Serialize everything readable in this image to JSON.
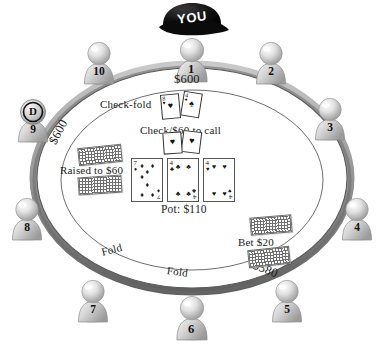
{
  "diagram": {
    "table": {
      "pot_label": "Pot: $110",
      "rim_color": "#8a8a8a",
      "felt_color": "#ffffff",
      "line_color": "#555555"
    },
    "hero": {
      "cap_label": "YOU",
      "cap_color": "#111111"
    },
    "stacks": [
      {
        "id": "stack-top",
        "value": "$600"
      },
      {
        "id": "stack-left",
        "value": "$600"
      },
      {
        "id": "stack-right",
        "value": "$580"
      }
    ],
    "actions": [
      {
        "id": "action-check-fold",
        "label": "Check-fold"
      },
      {
        "id": "action-check-call",
        "label": "Check/$60 to call"
      },
      {
        "id": "action-raise",
        "label": "Raised to $60"
      },
      {
        "id": "action-bet",
        "label": "Bet $20"
      },
      {
        "id": "action-fold-left",
        "label": "Fold"
      },
      {
        "id": "action-fold-right",
        "label": "Fold"
      }
    ],
    "board_cards": [
      {
        "rank": "7",
        "suit": "♦",
        "name": "seven-of-diamonds"
      },
      {
        "rank": "4",
        "suit": "♣",
        "name": "four-of-clubs"
      },
      {
        "rank": "4",
        "suit": "♥",
        "name": "four-of-hearts"
      }
    ],
    "hole_cards_top": [
      {
        "rank": "8",
        "suit": "♥",
        "name": "eight-of-hearts"
      },
      {
        "rank": "4",
        "suit": "♠",
        "name": "four-of-spades"
      }
    ],
    "hole_cards_center": [
      {
        "rank": "",
        "suit": "♥",
        "name": "hidden-heart-card"
      },
      {
        "rank": "",
        "suit": "♥",
        "name": "hidden-heart-card"
      }
    ],
    "seats": [
      {
        "id": "seat-1",
        "label": "1"
      },
      {
        "id": "seat-2",
        "label": "2"
      },
      {
        "id": "seat-3",
        "label": "3"
      },
      {
        "id": "seat-4",
        "label": "4"
      },
      {
        "id": "seat-5",
        "label": "5"
      },
      {
        "id": "seat-6",
        "label": "6"
      },
      {
        "id": "seat-7",
        "label": "7"
      },
      {
        "id": "seat-8",
        "label": "8"
      },
      {
        "id": "seat-9",
        "label": "9"
      },
      {
        "id": "seat-10",
        "label": "10"
      }
    ],
    "dealer_button": {
      "label": "D",
      "seat": "9"
    }
  }
}
